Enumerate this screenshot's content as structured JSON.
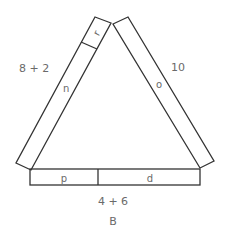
{
  "diagram": {
    "type": "triangle-of-bars",
    "stroke_color": "#333333",
    "label_color": "#6a6a6a",
    "caption": "B",
    "sides": {
      "left": {
        "label": "8 + 2",
        "segments": [
          "r",
          "n"
        ]
      },
      "right": {
        "label": "10",
        "segments": [
          "o"
        ]
      },
      "bottom": {
        "label": "4 + 6",
        "segments": [
          "p",
          "d"
        ]
      }
    }
  }
}
